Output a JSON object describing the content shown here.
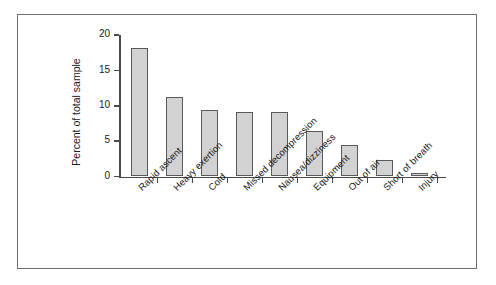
{
  "chart_data": {
    "type": "bar",
    "title": "",
    "subtitle": "",
    "xlabel": "",
    "ylabel": "Percent of total sample",
    "categories": [
      "Rapid ascent",
      "Heavy exertion",
      "Cold",
      "Missed decompression",
      "Nausea/dizziness",
      "Equipment",
      "Out of air",
      "Short of breath",
      "Injury"
    ],
    "values": [
      18.1,
      11.2,
      9.4,
      9.1,
      9.1,
      6.4,
      4.5,
      2.4,
      0.5
    ],
    "ylim": [
      0,
      20
    ],
    "ytick_labels": [
      "0",
      "5",
      "10",
      "15",
      "20"
    ],
    "ytick_values": [
      0,
      5,
      10,
      15,
      20
    ],
    "grid": false,
    "legend": false,
    "legend_position": "none",
    "bar_fill_color": "#d2d2d2",
    "bar_edge_color": "#5a5a5a",
    "axis_color": "#4a4a4a",
    "frame_color": "#6e6e6e",
    "background_color": "#ffffff",
    "xtick_label_rotation": -45
  }
}
